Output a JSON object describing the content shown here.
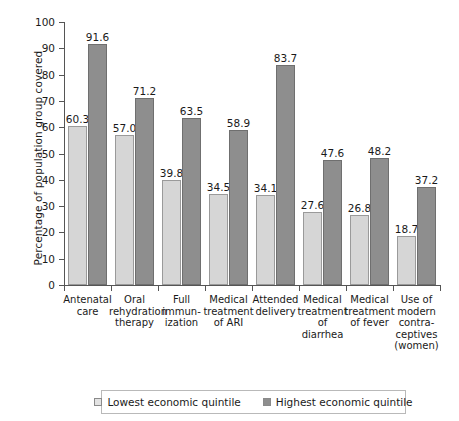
{
  "chart_data": {
    "type": "bar",
    "title": "",
    "subtitle": "",
    "xlabel": "",
    "ylabel": "Percentage of population group covered",
    "ylim": [
      0,
      100
    ],
    "yticks": [
      0,
      10,
      20,
      30,
      40,
      50,
      60,
      70,
      80,
      90,
      100
    ],
    "grid": false,
    "legend_position": "bottom",
    "categories": [
      "Antenatal care",
      "Oral rehydration therapy",
      "Full immun-ization",
      "Medical treatment of ARI",
      "Attended delivery",
      "Medical treatment of diarrhea",
      "Medical treatment of fever",
      "Use of modern contra-ceptives (women)"
    ],
    "category_lines": [
      [
        "Antenatal",
        "care"
      ],
      [
        "Oral",
        "rehydration",
        "therapy"
      ],
      [
        "Full",
        "immun-",
        "ization"
      ],
      [
        "Medical",
        "treatment",
        "of ARI"
      ],
      [
        "Attended",
        "delivery"
      ],
      [
        "Medical",
        "treatment",
        "of diarrhea"
      ],
      [
        "Medical",
        "treatment",
        "of fever"
      ],
      [
        "Use of",
        "modern",
        "contra-",
        "ceptives",
        "(women)"
      ]
    ],
    "series": [
      {
        "name": "Lowest economic quintile",
        "color": "#d6d6d6",
        "values": [
          60.3,
          57.0,
          39.8,
          34.5,
          34.1,
          27.6,
          26.8,
          18.7
        ]
      },
      {
        "name": "Highest economic quintile",
        "color": "#8e8e8e",
        "values": [
          91.6,
          71.2,
          63.5,
          58.9,
          83.7,
          47.6,
          48.2,
          37.2
        ]
      }
    ]
  },
  "legend": {
    "entries": [
      {
        "label": "Lowest economic quintile"
      },
      {
        "label": "Highest economic quintile"
      }
    ]
  }
}
